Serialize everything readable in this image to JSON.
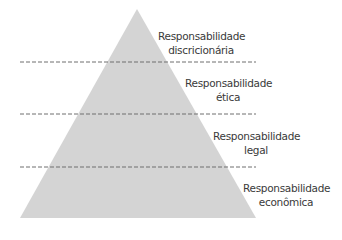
{
  "diagram": {
    "type": "pyramid",
    "colors": {
      "fill": "#d4d4d4",
      "divider": "#6e6e6e",
      "text": "#3a3a3a"
    },
    "levels": [
      {
        "line1": "Responsabilidade",
        "line2": "discricionária"
      },
      {
        "line1": "Responsabilidade",
        "line2": "ética"
      },
      {
        "line1": "Responsabilidade",
        "line2": "legal"
      },
      {
        "line1": "Responsabilidade",
        "line2": "econômica"
      }
    ]
  }
}
